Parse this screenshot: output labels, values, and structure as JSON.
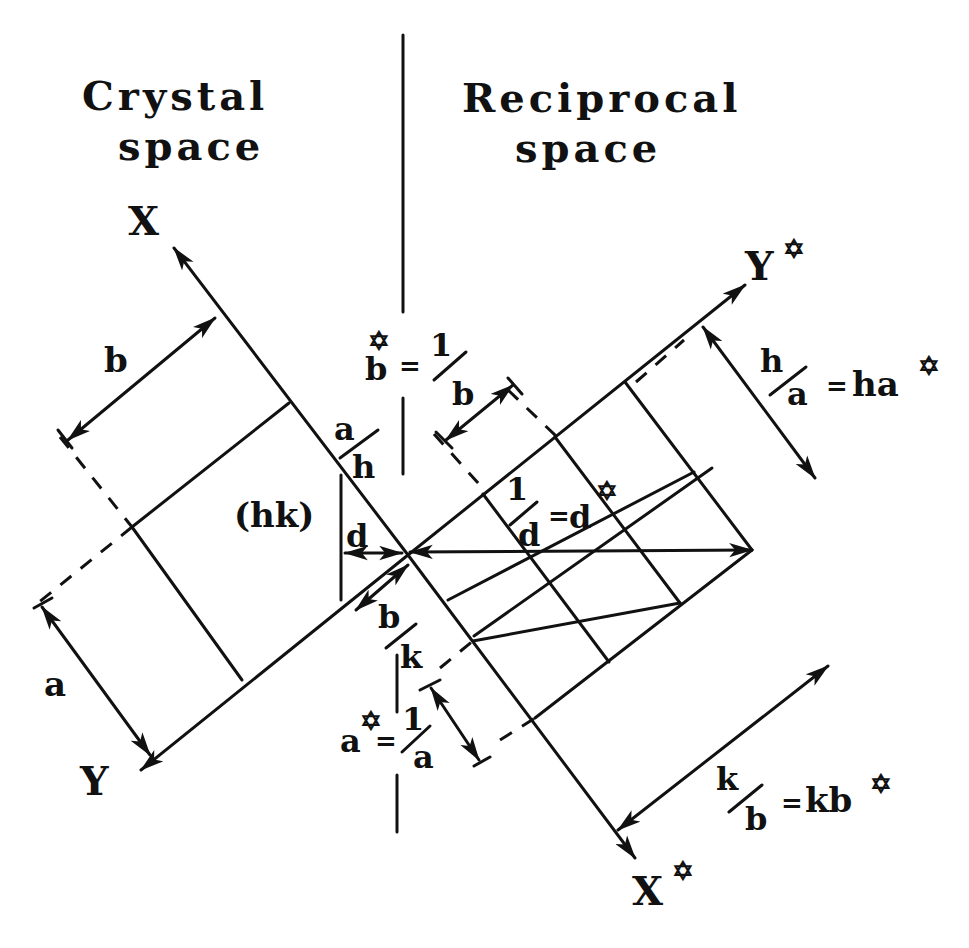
{
  "titles": {
    "left_line1": "Crystal",
    "left_line2": "space",
    "right_line1": "Reciprocal",
    "right_line2": "space"
  },
  "axes": {
    "x": "X",
    "y": "Y",
    "x_star": "X",
    "y_star": "Y",
    "star": "✡"
  },
  "crystal_labels": {
    "b": "b",
    "a": "a",
    "plane": "(hk)",
    "a_over_h_num": "a",
    "a_over_h_den": "h",
    "d": "d",
    "b_over_k_num": "b",
    "b_over_k_den": "k"
  },
  "reciprocal_labels": {
    "b_star_lhs": "b",
    "b_star_eq": "=",
    "b_star_num": "1",
    "b_star_den": "b",
    "a_star_lhs": "a",
    "a_star_eq": "=",
    "a_star_num": "1",
    "a_star_den": "a",
    "inv_d_num": "1",
    "inv_d_den": "d",
    "inv_d_eq": "=",
    "inv_d_rhs": "d",
    "h_over_a_num": "h",
    "h_over_a_den": "a",
    "h_over_a_eq": "=",
    "h_over_a_rhs": "ha",
    "k_over_b_num": "k",
    "k_over_b_den": "b",
    "k_over_b_eq": "=",
    "k_over_b_rhs": "kb"
  }
}
